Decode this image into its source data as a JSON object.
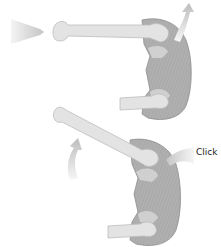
{
  "figure": {
    "panels": [
      {
        "id": "top",
        "elements": [
          "push-arrow",
          "femur",
          "pelvis-socket",
          "curved-arrow-up"
        ]
      },
      {
        "id": "bottom",
        "elements": [
          "femur",
          "pelvis-socket",
          "curved-arrow-left",
          "click-arrow"
        ]
      }
    ],
    "click_label": "Click"
  },
  "colors": {
    "background": "#ffffff",
    "bone_fill": "#e3e3e3",
    "bone_stroke": "#b8b8b8",
    "pelvis_fill": "#a9a9a9",
    "pelvis_stroke": "#8a8a8a",
    "arrow_light": "#f2f2f2",
    "arrow_dark": "#c8c8c8",
    "text": "#222222"
  }
}
